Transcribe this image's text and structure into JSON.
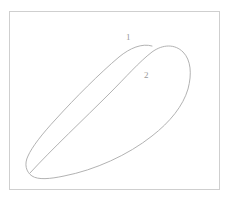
{
  "figure": {
    "kind": "line-drawing",
    "background_color": "#ffffff",
    "frame": {
      "name": "outer-border",
      "stroke_color": "#cfcfcf",
      "stroke_width": 1,
      "x": 9,
      "y": 11,
      "width": 210,
      "height": 178
    },
    "curve": {
      "name": "airfoil-outline",
      "stroke_color": "#a9a9a9",
      "stroke_width": 0.9,
      "fill": "none",
      "closed": true,
      "leading_edge_right_x": 190,
      "trailing_edge_tip": [
        30,
        173
      ],
      "top_apex": [
        150,
        46
      ],
      "leftmost_point": [
        28,
        156
      ]
    },
    "labels": [
      {
        "name": "curve-label-1",
        "text": "1",
        "x": 129,
        "y": 38,
        "color": "#9a9a9a",
        "position": "above upper surface"
      },
      {
        "name": "curve-label-2",
        "text": "2",
        "x": 147,
        "y": 76,
        "color": "#9a9a9a",
        "position": "inside shape"
      }
    ]
  }
}
